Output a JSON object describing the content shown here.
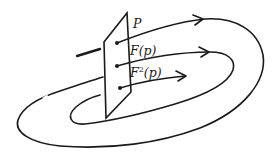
{
  "diagram": {
    "section_label": "P",
    "points": [
      {
        "id": "F1",
        "label_base": "F",
        "label_exp": "",
        "label_arg": "(p)"
      },
      {
        "id": "F2",
        "label_base": "F",
        "label_exp": "2",
        "label_arg": "(p)"
      }
    ],
    "stroke_color": "#1a1a1a",
    "background_color": "#ffffff"
  }
}
